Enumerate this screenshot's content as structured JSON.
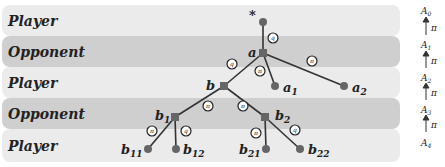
{
  "rows": [
    {
      "label": "Player"
    },
    {
      "label": "Opponent"
    },
    {
      "label": "Player"
    },
    {
      "label": "Opponent"
    },
    {
      "label": "Player"
    }
  ],
  "nodes": {
    "root": "*",
    "a": "a",
    "a1": "a",
    "a1_sub": "1",
    "a2": "a",
    "a2_sub": "2",
    "b": "b",
    "b1": "b",
    "b1_sub": "1",
    "b2": "b",
    "b2_sub": "2",
    "b11": "b",
    "b11_sub": "11",
    "b12": "b",
    "b12_sub": "12",
    "b21": "b",
    "b21_sub": "21",
    "b22": "b",
    "b22_sub": "22"
  },
  "edge_labels": {
    "root_a": "q",
    "a_b": "q",
    "a_a1": "π",
    "a_a2": "π",
    "b_b1": "π",
    "b_b2": "π",
    "b1_b11": "π",
    "b1_b12": "q",
    "b2_b21": "π",
    "b2_b22": "q"
  },
  "axis": {
    "levels": [
      "A",
      "A",
      "A",
      "A",
      "A"
    ],
    "subs": [
      "0",
      "1",
      "2",
      "3",
      "4"
    ],
    "arrow_label": "π"
  }
}
